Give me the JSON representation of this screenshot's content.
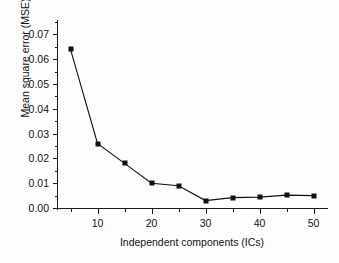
{
  "chart_data": {
    "type": "line",
    "title": "",
    "xlabel": "Independent components (ICs)",
    "ylabel": "Mean square error (MSE)",
    "x": [
      5,
      10,
      15,
      20,
      25,
      30,
      35,
      40,
      45,
      50
    ],
    "values": [
      0.064,
      0.026,
      0.018,
      0.01,
      0.009,
      0.003,
      0.0042,
      0.0044,
      0.0052,
      0.005
    ],
    "series": [
      {
        "name": "MSE",
        "values": [
          0.064,
          0.026,
          0.018,
          0.01,
          0.009,
          0.003,
          0.0042,
          0.0044,
          0.0052,
          0.005
        ]
      }
    ],
    "xlim": [
      2.5,
      52.5
    ],
    "ylim": [
      0.0,
      0.075
    ],
    "x_ticks": [
      10,
      20,
      30,
      40,
      50
    ],
    "x_tick_labels": [
      "10",
      "20",
      "30",
      "40",
      "50"
    ],
    "x_minor_ticks": [
      5,
      15,
      25,
      35,
      45
    ],
    "y_ticks": [
      0.0,
      0.01,
      0.02,
      0.03,
      0.04,
      0.05,
      0.06,
      0.07
    ],
    "y_tick_labels": [
      "0.00",
      "0.01",
      "0.02",
      "0.03",
      "0.04",
      "0.05",
      "0.06",
      "0.07"
    ],
    "y_minor_ticks": [
      0.005,
      0.015,
      0.025,
      0.035,
      0.045,
      0.055,
      0.065,
      0.075
    ],
    "grid": false,
    "legend": false,
    "marker": "square",
    "line_color": "#111111",
    "marker_color": "#111111",
    "background_color": "#fdfdfd"
  }
}
